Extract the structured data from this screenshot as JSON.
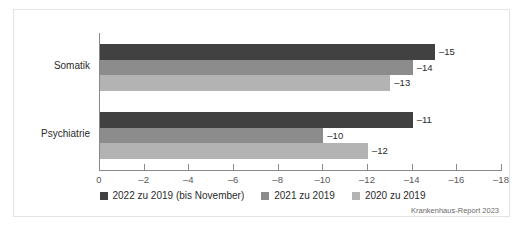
{
  "chart_data": {
    "type": "bar",
    "orientation": "horizontal",
    "title": "",
    "subtitle": "",
    "xlabel": "",
    "ylabel": "",
    "categories": [
      "Somatik",
      "Psychiatrie"
    ],
    "series": [
      {
        "name": "2022 zu 2019 (bis November)",
        "color": "#414141",
        "values": [
          -15,
          -14
        ],
        "labels": [
          "–15",
          "–11"
        ]
      },
      {
        "name": "2021 zu 2019",
        "color": "#8c8c8c",
        "values": [
          -14,
          -10
        ],
        "labels": [
          "–14",
          "–10"
        ]
      },
      {
        "name": "2020 zu 2019",
        "color": "#b3b3b3",
        "values": [
          -13,
          -12
        ],
        "labels": [
          "–13",
          "–12"
        ]
      }
    ],
    "bars": [
      {
        "category": "Somatik",
        "series": "2022 zu 2019 (bis November)",
        "value": -15,
        "label": "–15"
      },
      {
        "category": "Somatik",
        "series": "2021 zu 2019",
        "value": -14,
        "label": "–14"
      },
      {
        "category": "Somatik",
        "series": "2020 zu 2019",
        "value": -13,
        "label": "–13"
      },
      {
        "category": "Psychiatrie",
        "series": "2022 zu 2019 (bis November)",
        "value": -11,
        "label": "–11"
      },
      {
        "category": "Psychiatrie",
        "series": "2021 zu 2019",
        "value": -10,
        "label": "–10"
      },
      {
        "category": "Psychiatrie",
        "series": "2020 zu 2019",
        "value": -12,
        "label": "–12"
      }
    ],
    "xlim": [
      0,
      -18
    ],
    "xticks": [
      0,
      -2,
      -4,
      -6,
      -8,
      -10,
      -12,
      -14,
      -16,
      -18
    ],
    "xticklabels": [
      "0",
      "–2",
      "–4",
      "–6",
      "–8",
      "–10",
      "–12",
      "–14",
      "–16",
      "–18"
    ],
    "grid": false,
    "legend_position": "bottom"
  },
  "legend": {
    "items": [
      {
        "label": "2022 zu 2019 (bis November)",
        "color": "#414141"
      },
      {
        "label": "2021 zu 2019",
        "color": "#8c8c8c"
      },
      {
        "label": "2020 zu 2019",
        "color": "#b3b3b3"
      }
    ]
  },
  "credit": {
    "text": "Krankenhaus-Report 2023"
  }
}
